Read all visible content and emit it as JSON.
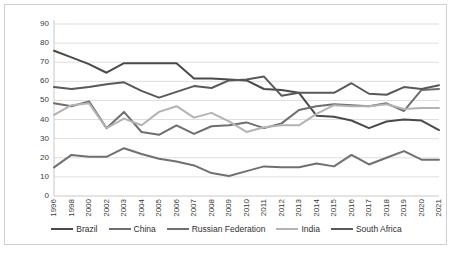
{
  "chart_data": {
    "type": "line",
    "title": "",
    "xlabel": "",
    "ylabel": "Corruption control level",
    "ylim": [
      0,
      90
    ],
    "ytick_step": 10,
    "grid": true,
    "legend_position": "bottom",
    "categories": [
      "1996",
      "1998",
      "2000",
      "2002",
      "2003",
      "2004",
      "2005",
      "2006",
      "2007",
      "2008",
      "2009",
      "2010",
      "2011",
      "2012",
      "2013",
      "2014",
      "2015",
      "2016",
      "2017",
      "2018",
      "2019",
      "2020",
      "2021"
    ],
    "yticks": [
      0,
      10,
      20,
      30,
      40,
      50,
      60,
      70,
      80,
      90
    ],
    "series": [
      {
        "name": "Brazil",
        "color": "#4a4a4a",
        "values": [
          76.0,
          72.5,
          69.0,
          64.5,
          69.5,
          69.5,
          69.5,
          69.5,
          61.5,
          61.5,
          61.0,
          60.5,
          56.0,
          55.5,
          54.0,
          42.0,
          41.5,
          39.5,
          35.5,
          39.0,
          40.0,
          39.5,
          34.5
        ]
      },
      {
        "name": "China",
        "color": "#6e6e6e",
        "values": [
          48.5,
          47.0,
          49.5,
          35.5,
          44.0,
          33.5,
          32.0,
          37.0,
          32.5,
          36.5,
          37.0,
          38.5,
          35.5,
          38.0,
          45.0,
          47.0,
          48.0,
          47.5,
          47.0,
          48.5,
          44.5,
          55.5,
          56.0
        ]
      },
      {
        "name": "Russian Federation",
        "color": "#707070",
        "values": [
          15.0,
          21.5,
          20.5,
          20.5,
          25.0,
          22.0,
          19.5,
          18.0,
          16.0,
          12.0,
          10.5,
          13.0,
          15.5,
          15.0,
          15.0,
          17.0,
          15.5,
          21.5,
          16.5,
          20.0,
          23.5,
          19.0,
          19.0
        ]
      },
      {
        "name": "India",
        "color": "#b3b3b3",
        "values": [
          42.5,
          47.5,
          48.5,
          35.5,
          40.5,
          37.0,
          44.0,
          47.0,
          41.0,
          43.5,
          39.0,
          33.5,
          36.0,
          37.0,
          37.0,
          43.0,
          47.5,
          47.0,
          47.0,
          48.0,
          45.5,
          46.0,
          46.0
        ]
      },
      {
        "name": "South Africa",
        "color": "#595959",
        "values": [
          57.0,
          56.0,
          57.0,
          58.5,
          59.5,
          55.0,
          51.5,
          54.5,
          57.5,
          56.5,
          60.5,
          61.0,
          62.5,
          52.5,
          54.0,
          54.0,
          54.0,
          59.0,
          53.5,
          53.0,
          57.0,
          56.0,
          58.0
        ]
      }
    ]
  },
  "legend": {
    "items": [
      {
        "label": "Brazil"
      },
      {
        "label": "China"
      },
      {
        "label": "Russian Federation"
      },
      {
        "label": "India"
      },
      {
        "label": "South Africa"
      }
    ]
  }
}
